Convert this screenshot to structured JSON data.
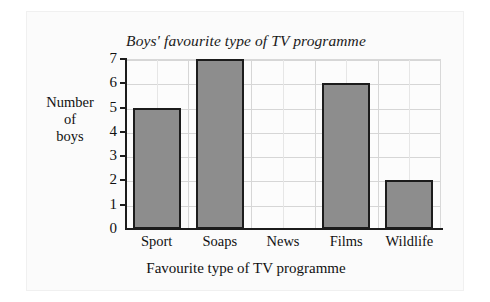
{
  "chart_data": {
    "type": "bar",
    "title": "Boys' favourite type of TV programme",
    "xlabel": "Favourite type of TV programme",
    "ylabel": "Number of boys",
    "ylabel_lines": [
      "Number",
      "of",
      "boys"
    ],
    "categories": [
      "Sport",
      "Soaps",
      "News",
      "Films",
      "Wildlife"
    ],
    "values": [
      5,
      7,
      0,
      6,
      2
    ],
    "ytick_labels": [
      "0",
      "1",
      "2",
      "3",
      "4",
      "5",
      "6",
      "7"
    ],
    "yticks": [
      0,
      1,
      2,
      3,
      4,
      5,
      6,
      7
    ],
    "ylim": [
      0,
      7
    ],
    "grid": true,
    "legend": null,
    "colors": {
      "bar_fill": "#8d8d8d",
      "bar_edge": "#1c1c1c",
      "axis": "#1c1c1c",
      "grid": "#d6d6d6",
      "background": "#fbfbfb",
      "plot_background": "#fcfcfc",
      "text": "#111111"
    }
  }
}
